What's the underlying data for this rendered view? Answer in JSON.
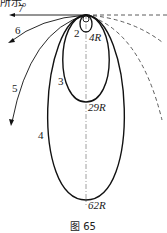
{
  "figure": {
    "caption": "图 65",
    "top_fragment": "所示。",
    "curves": [
      {
        "id": "2",
        "label": "2",
        "end_label": "4R",
        "style": "solid-thick"
      },
      {
        "id": "3",
        "label": "3",
        "end_label": "29R",
        "style": "solid-thick"
      },
      {
        "id": "4",
        "label": "4",
        "end_label": "62R",
        "style": "solid-thick"
      },
      {
        "id": "5",
        "label": "5",
        "style": "solid-thin-arrow"
      },
      {
        "id": "6",
        "label": "6",
        "style": "solid-thin-arrow"
      },
      {
        "id": "7",
        "label": "7",
        "style": "solid-thin-arrow"
      }
    ],
    "colors": {
      "line": "#111111",
      "axis": "#888888",
      "background": "#ffffff"
    }
  }
}
